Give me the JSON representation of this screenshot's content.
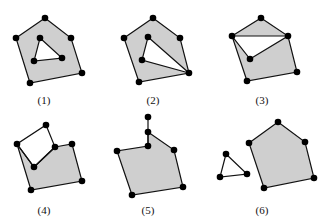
{
  "figures": [
    {
      "label": "(1)",
      "label_pos": [
        44,
        100
      ],
      "description": "pentagon with a triangular hole",
      "outer": [
        [
          45,
          18
        ],
        [
          71,
          38
        ],
        [
          82,
          73
        ],
        [
          30,
          83
        ],
        [
          16,
          38
        ]
      ],
      "holes": [
        [
          [
            40,
            38
          ],
          [
            62,
            58
          ],
          [
            34,
            61
          ]
        ]
      ],
      "extra_edges": [],
      "vertices": [
        [
          45,
          18
        ],
        [
          71,
          38
        ],
        [
          82,
          73
        ],
        [
          30,
          83
        ],
        [
          16,
          38
        ],
        [
          40,
          38
        ],
        [
          62,
          58
        ],
        [
          34,
          61
        ]
      ]
    },
    {
      "label": "(2)",
      "label_pos": [
        153,
        100
      ],
      "description": "pentagon with a triangular hole touching the boundary at a vertex",
      "outer": [
        [
          153,
          18
        ],
        [
          180,
          38
        ],
        [
          189,
          73
        ],
        [
          139,
          82
        ],
        [
          124,
          38
        ]
      ],
      "holes": [
        [
          [
            148,
            37
          ],
          [
            189,
            73
          ],
          [
            142,
            60
          ]
        ]
      ],
      "extra_edges": [],
      "vertices": [
        [
          153,
          18
        ],
        [
          180,
          38
        ],
        [
          189,
          73
        ],
        [
          139,
          82
        ],
        [
          124,
          38
        ],
        [
          148,
          37
        ],
        [
          142,
          60
        ]
      ]
    },
    {
      "label": "(3)",
      "label_pos": [
        262,
        100
      ],
      "description": "pentagon with a triangular hole sharing an edge-chain with the boundary",
      "outer": [
        [
          261,
          18
        ],
        [
          288,
          36
        ],
        [
          297,
          72
        ],
        [
          247,
          81
        ],
        [
          232,
          36
        ]
      ],
      "holes": [
        [
          [
            232,
            36
          ],
          [
            288,
            36
          ],
          [
            250,
            59
          ]
        ]
      ],
      "extra_edges": [],
      "vertices": [
        [
          261,
          18
        ],
        [
          288,
          36
        ],
        [
          297,
          72
        ],
        [
          247,
          81
        ],
        [
          232,
          36
        ],
        [
          250,
          59
        ]
      ]
    },
    {
      "label": "(4)",
      "label_pos": [
        44,
        210
      ],
      "description": "pentagon with a notch cut from the top edge",
      "outer": [
        [
          46,
          125
        ],
        [
          55,
          147
        ],
        [
          72,
          144
        ],
        [
          82,
          181
        ],
        [
          31,
          190
        ],
        [
          17,
          144
        ]
      ],
      "holes": [],
      "extra_edges": [
        [
          [
            17,
            144
          ],
          [
            34,
            167
          ]
        ],
        [
          [
            34,
            167
          ],
          [
            55,
            147
          ]
        ]
      ],
      "filled": [
        [
          55,
          147
        ],
        [
          72,
          144
        ],
        [
          82,
          181
        ],
        [
          31,
          190
        ],
        [
          17,
          144
        ],
        [
          34,
          167
        ]
      ],
      "outline_only": [
        [
          46,
          125
        ],
        [
          55,
          147
        ],
        [
          34,
          167
        ],
        [
          17,
          144
        ]
      ],
      "vertices": [
        [
          46,
          125
        ],
        [
          17,
          144
        ],
        [
          55,
          147
        ],
        [
          72,
          144
        ],
        [
          34,
          167
        ],
        [
          82,
          181
        ],
        [
          31,
          190
        ]
      ]
    },
    {
      "label": "(5)",
      "label_pos": [
        148,
        210
      ],
      "description": "pentagon with a dangling edge path",
      "outer": [
        [
          148,
          132
        ],
        [
          174,
          150
        ],
        [
          183,
          187
        ],
        [
          132,
          195
        ],
        [
          117,
          151
        ],
        [
          148,
          146
        ]
      ],
      "holes": [],
      "extra_edges": [
        [
          [
            148,
            117
          ],
          [
            148,
            132
          ]
        ],
        [
          [
            148,
            132
          ],
          [
            148,
            146
          ]
        ]
      ],
      "vertices": [
        [
          148,
          117
        ],
        [
          148,
          132
        ],
        [
          148,
          146
        ],
        [
          117,
          151
        ],
        [
          174,
          150
        ],
        [
          183,
          187
        ],
        [
          132,
          195
        ]
      ]
    },
    {
      "label": "(6)",
      "label_pos": [
        262,
        210
      ],
      "description": "pentagon plus a separate unfilled triangle",
      "outer": [
        [
          278,
          122
        ],
        [
          305,
          142
        ],
        [
          314,
          178
        ],
        [
          264,
          188
        ],
        [
          249,
          143
        ]
      ],
      "holes": [],
      "separate_triangle": [
        [
          226,
          154
        ],
        [
          247,
          174
        ],
        [
          220,
          177
        ]
      ],
      "extra_edges": [],
      "vertices": [
        [
          278,
          122
        ],
        [
          305,
          142
        ],
        [
          314,
          178
        ],
        [
          264,
          188
        ],
        [
          249,
          143
        ],
        [
          226,
          154
        ],
        [
          247,
          174
        ],
        [
          220,
          177
        ]
      ]
    }
  ],
  "style": {
    "fill": "#cfcfcf",
    "stroke": "#111111",
    "vertex": "#000000"
  }
}
